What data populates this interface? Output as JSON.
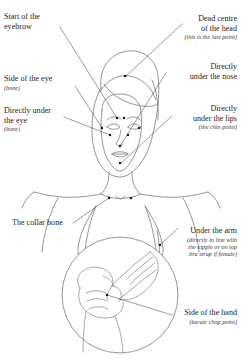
{
  "diagram": {
    "ink_color": "#6d6d72",
    "dot_color": "#1b1b1b",
    "leader_color": "#4a4a4a",
    "background": "#ffffff"
  },
  "labels": {
    "eyebrow": {
      "line1": "Start of the",
      "line2": "eyebrow"
    },
    "top_of_head": {
      "line1": "Dead centre",
      "line2": "of the head",
      "note": "(this is the last point)"
    },
    "side_of_eye": {
      "line1": "Side of the eye",
      "note": "(bone)"
    },
    "under_nose": {
      "line1": "Directly",
      "line2": "under the nose"
    },
    "under_eye": {
      "line1": "Directly under",
      "line2": "the eye",
      "note": "(bone)"
    },
    "under_lips": {
      "line1": "Directly",
      "line2": "under the lips",
      "note": "(the chin point)"
    },
    "collar_bone": {
      "line1": "The collar bone"
    },
    "under_arm": {
      "line1": "Under  the arm",
      "note1": "(directly in line with",
      "note2": "the nipple or on top",
      "note3": "bra strap if female)"
    },
    "side_of_hand": {
      "line1": "Side of the hand",
      "note": "(karate chop point)"
    }
  },
  "points": [
    {
      "name": "top-of-head-point",
      "x": 125,
      "y": 76
    },
    {
      "name": "eyebrow-point-left",
      "x": 117,
      "y": 118
    },
    {
      "name": "eyebrow-point-right",
      "x": 124,
      "y": 118
    },
    {
      "name": "side-of-eye-left",
      "x": 102,
      "y": 128
    },
    {
      "name": "side-of-eye-right",
      "x": 139,
      "y": 128
    },
    {
      "name": "under-eye-left",
      "x": 110,
      "y": 135
    },
    {
      "name": "under-eye-right",
      "x": 128,
      "y": 135
    },
    {
      "name": "under-nose-point",
      "x": 120,
      "y": 146
    },
    {
      "name": "under-lips-point",
      "x": 120,
      "y": 163
    },
    {
      "name": "collar-bone-left",
      "x": 109,
      "y": 198
    },
    {
      "name": "collar-bone-right",
      "x": 131,
      "y": 198
    },
    {
      "name": "under-arm-point",
      "x": 160,
      "y": 245
    },
    {
      "name": "karate-chop-point",
      "x": 107,
      "y": 295
    }
  ]
}
